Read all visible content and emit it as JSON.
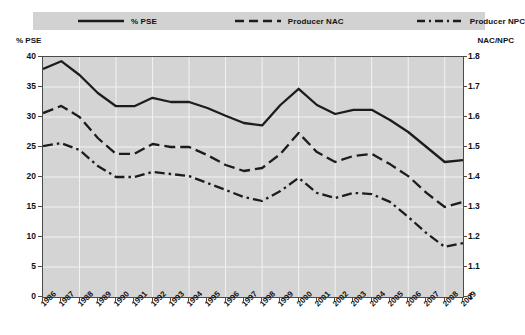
{
  "legend": {
    "items": [
      {
        "label": "% PSE",
        "key": "solid-line-key",
        "style": "solid",
        "color": "#1c1c1c"
      },
      {
        "label": "Producer NAC",
        "key": "dashed-line-key",
        "style": "dashed",
        "color": "#1c1c1c"
      },
      {
        "label": "Producer NPC",
        "key": "dash-dot-line-key",
        "style": "dash-dot",
        "color": "#1c1c1c"
      }
    ],
    "background": "#d2d2d2"
  },
  "axis_captions": {
    "left": "% PSE",
    "right": "NAC/NPC"
  },
  "chart_data": {
    "type": "line",
    "title": "",
    "xlabel": "",
    "ylabel": "% PSE",
    "y2label": "NAC/NPC",
    "ylim": [
      0,
      40
    ],
    "y2lim": [
      1,
      1.8
    ],
    "yticks": [
      "0",
      "5",
      "10",
      "15",
      "20",
      "25",
      "30",
      "35",
      "40"
    ],
    "y2ticks": [
      "1",
      "1.1",
      "1.2",
      "1.3",
      "1.4",
      "1.5",
      "1.6",
      "1.7",
      "1.8"
    ],
    "grid": true,
    "legend_position": "top",
    "plot_background": "#d4d4d4",
    "categories": [
      "1986",
      "1987",
      "1988",
      "1989",
      "1990",
      "1991",
      "1992",
      "1993",
      "1994",
      "1995",
      "1996",
      "1997",
      "1998",
      "1999",
      "2000",
      "2001",
      "2002",
      "2003",
      "2004",
      "2005",
      "2006",
      "2007",
      "2008",
      "2009"
    ],
    "series": [
      {
        "name": "% PSE",
        "axis": "left",
        "style": "solid",
        "values": [
          38.0,
          39.3,
          37.0,
          34.0,
          31.8,
          31.8,
          33.2,
          32.5,
          32.5,
          31.5,
          30.2,
          29.0,
          28.6,
          32.0,
          34.7,
          32.0,
          30.5,
          31.2,
          31.2,
          29.5,
          27.5,
          25.0,
          22.5,
          22.8
        ]
      },
      {
        "name": "Producer NAC",
        "axis": "right",
        "style": "dashed",
        "values": [
          1.613,
          1.637,
          1.6,
          1.53,
          1.477,
          1.477,
          1.51,
          1.5,
          1.5,
          1.473,
          1.44,
          1.42,
          1.43,
          1.477,
          1.547,
          1.483,
          1.45,
          1.47,
          1.477,
          1.443,
          1.403,
          1.347,
          1.3,
          1.317
        ]
      },
      {
        "name": "Producer NPC",
        "axis": "right",
        "style": "dash-dot",
        "values": [
          1.503,
          1.513,
          1.49,
          1.437,
          1.4,
          1.4,
          1.417,
          1.41,
          1.403,
          1.38,
          1.357,
          1.333,
          1.32,
          1.353,
          1.397,
          1.347,
          1.33,
          1.347,
          1.343,
          1.317,
          1.267,
          1.213,
          1.167,
          1.18
        ]
      }
    ]
  }
}
